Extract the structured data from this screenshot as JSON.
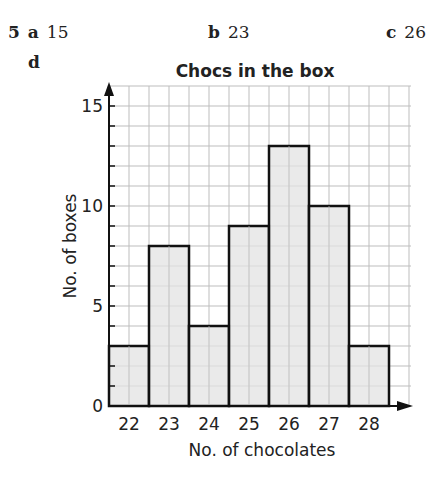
{
  "question": {
    "number": "5",
    "parts": [
      {
        "label": "a",
        "answer": "15"
      },
      {
        "label": "b",
        "answer": "23"
      },
      {
        "label": "c",
        "answer": "26"
      },
      {
        "label": "d",
        "answer": ""
      }
    ]
  },
  "chart_data": {
    "type": "bar",
    "title": "Chocs in the box",
    "xlabel": "No. of chocolates",
    "ylabel": "No. of boxes",
    "categories": [
      "22",
      "23",
      "24",
      "25",
      "26",
      "27",
      "28"
    ],
    "values": [
      3,
      8,
      4,
      9,
      13,
      10,
      3
    ],
    "ylim": [
      0,
      16
    ],
    "yticks": [
      0,
      5,
      10,
      15
    ],
    "grid": true,
    "bar_color": "#e3e3e3",
    "bar_edge_color": "#111111",
    "grid_color": "#bdbdbd"
  }
}
